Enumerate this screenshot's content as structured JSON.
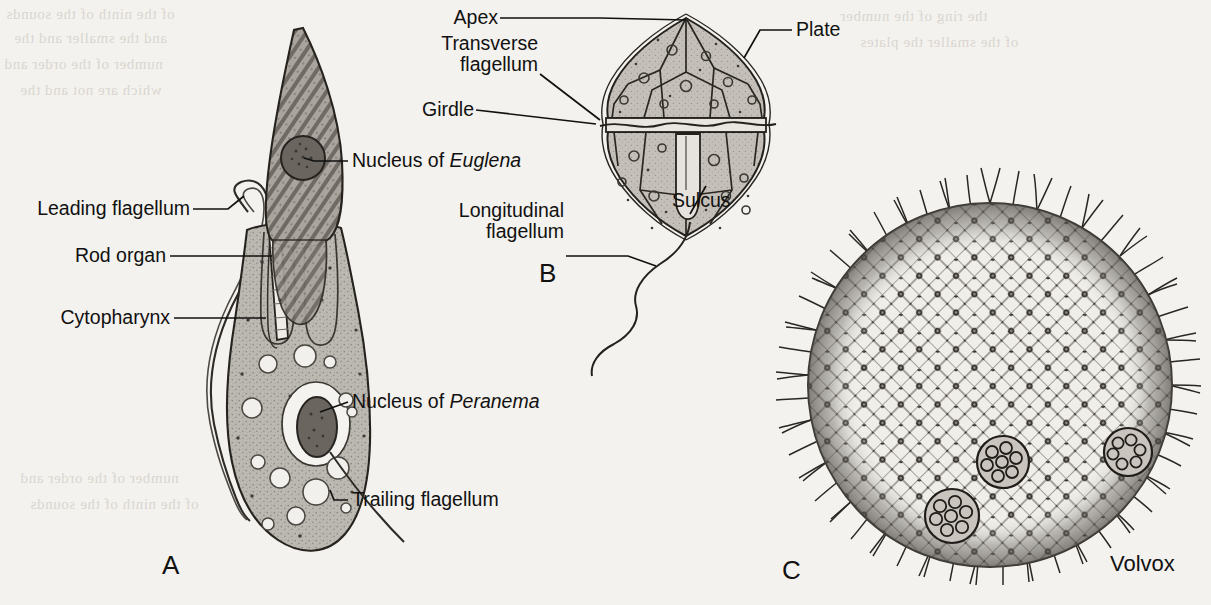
{
  "figure": {
    "background_color": "#f4f2ee",
    "ink_color": "#111111",
    "panels": [
      "A",
      "B",
      "C"
    ]
  },
  "panel_a": {
    "letter": "A",
    "subject": "Peranema engulfing Euglena",
    "labels": {
      "leading_flagellum": "Leading flagellum",
      "rod_organ": "Rod organ",
      "cytopharynx": "Cytopharynx",
      "nucleus_of_euglena_prefix": "Nucleus of ",
      "nucleus_of_euglena_genus": "Euglena",
      "nucleus_of_peranema_prefix": "Nucleus of ",
      "nucleus_of_peranema_genus": "Peranema",
      "trailing_flagellum": "Trailing flagellum"
    }
  },
  "panel_b": {
    "letter": "B",
    "subject": "Armored dinoflagellate",
    "labels": {
      "apex": "Apex",
      "plate": "Plate",
      "transverse_flagellum_line1": "Transverse",
      "transverse_flagellum_line2": "flagellum",
      "girdle": "Girdle",
      "longitudinal_flagellum_line1": "Longitudinal",
      "longitudinal_flagellum_line2": "flagellum",
      "sulcus": "Sulcus"
    }
  },
  "panel_c": {
    "letter": "C",
    "subject": "Volvox colony",
    "labels": {
      "volvox": "Volvox"
    }
  },
  "ghost_text": {
    "lines": [
      "of the ninth of the sounds",
      "and the smaller and the",
      "number of the order and",
      "which are not and the",
      "the ring of the number",
      "of the smaller the plates"
    ]
  }
}
